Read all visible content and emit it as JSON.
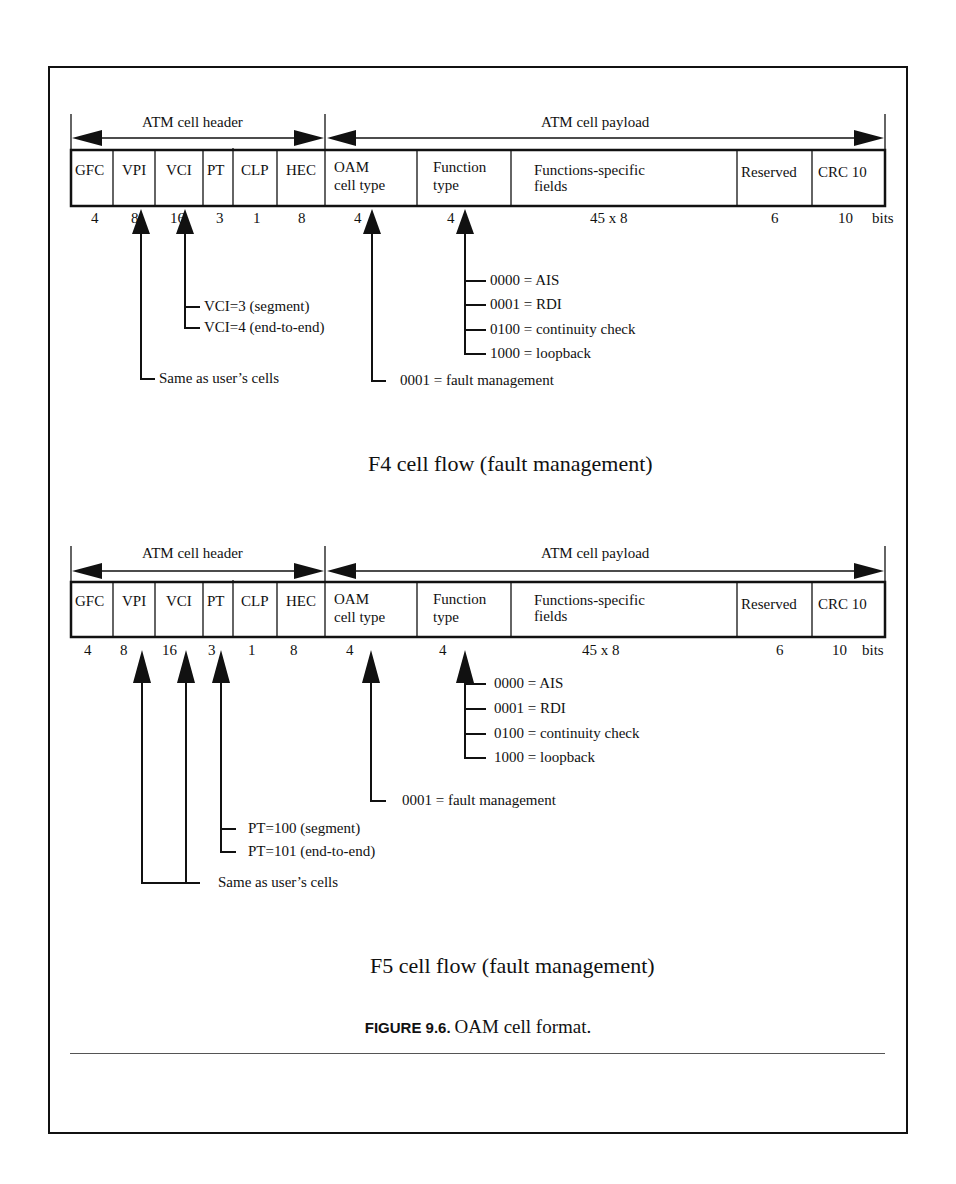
{
  "figure": {
    "caption_label": "FIGURE 9.6.",
    "caption_text": "OAM cell format."
  },
  "diagrams": [
    {
      "id": "f4",
      "title": "F4 cell flow (fault management)",
      "header_span_label": "ATM cell header",
      "payload_span_label": "ATM cell payload",
      "fields": [
        {
          "name": "GFC",
          "bits": "4"
        },
        {
          "name": "VPI",
          "bits": "8"
        },
        {
          "name": "VCI",
          "bits": "16"
        },
        {
          "name": "PT",
          "bits": "3"
        },
        {
          "name": "CLP",
          "bits": "1"
        },
        {
          "name": "HEC",
          "bits": "8"
        },
        {
          "name": "OAM",
          "name2": "cell type",
          "bits": "4"
        },
        {
          "name": "Function",
          "name2": "type",
          "bits": "4"
        },
        {
          "name": "Functions-specific",
          "name2": "fields",
          "bits": "45 x 8"
        },
        {
          "name": "Reserved",
          "bits": "6"
        },
        {
          "name": "CRC 10",
          "bits": "10"
        }
      ],
      "bits_unit": "bits",
      "annotations": {
        "vci": [
          "VCI=3 (segment)",
          "VCI=4 (end-to-end)"
        ],
        "vpi": "Same as user’s cells",
        "function_type": [
          "0000 = AIS",
          "0001 = RDI",
          "0100 = continuity check",
          "1000 = loopback"
        ],
        "oam_cell_type": "0001 = fault management"
      }
    },
    {
      "id": "f5",
      "title": "F5 cell flow (fault management)",
      "header_span_label": "ATM cell header",
      "payload_span_label": "ATM cell payload",
      "fields": [
        {
          "name": "GFC",
          "bits": "4"
        },
        {
          "name": "VPI",
          "bits": "8"
        },
        {
          "name": "VCI",
          "bits": "16"
        },
        {
          "name": "PT",
          "bits": "3"
        },
        {
          "name": "CLP",
          "bits": "1"
        },
        {
          "name": "HEC",
          "bits": "8"
        },
        {
          "name": "OAM",
          "name2": "cell type",
          "bits": "4"
        },
        {
          "name": "Function",
          "name2": "type",
          "bits": "4"
        },
        {
          "name": "Functions-specific",
          "name2": "fields",
          "bits": "45 x 8"
        },
        {
          "name": "Reserved",
          "bits": "6"
        },
        {
          "name": "CRC 10",
          "bits": "10"
        }
      ],
      "bits_unit": "bits",
      "annotations": {
        "function_type": [
          "0000 = AIS",
          "0001 = RDI",
          "0100 = continuity check",
          "1000 = loopback"
        ],
        "oam_cell_type": "0001 = fault management",
        "pt": [
          "PT=100 (segment)",
          "PT=101 (end-to-end)"
        ],
        "vpi_vci": "Same as user’s cells"
      }
    }
  ]
}
